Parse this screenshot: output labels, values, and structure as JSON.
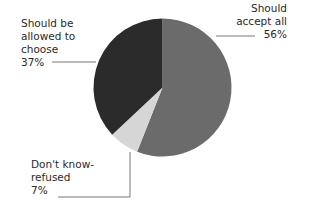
{
  "chart_data": {
    "type": "pie",
    "title": "",
    "start_angle_deg": 0,
    "direction": "clockwise",
    "slices": [
      {
        "label": "Should accept all",
        "value": 56,
        "color": "#6b6b6b"
      },
      {
        "label": "Don't know-refused",
        "value": 7,
        "color": "#d6d6d6"
      },
      {
        "label": "Should be allowed to choose",
        "value": 37,
        "color": "#2b2b2b"
      }
    ],
    "legend": "none (leader-line labels)"
  },
  "labels": {
    "accept": {
      "line1": "Should",
      "line2": "accept all",
      "pct": "56%"
    },
    "choose": {
      "line1": "Should be",
      "line2": "allowed to",
      "line3": "choose",
      "pct": "37%"
    },
    "dontknow": {
      "line1": "Don't know-",
      "line2": "refused",
      "pct": "7%"
    }
  }
}
